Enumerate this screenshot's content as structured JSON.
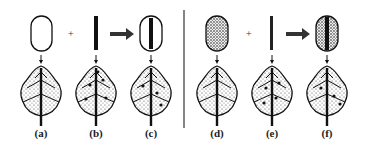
{
  "figure": {
    "operators": {
      "plus": "+",
      "arrow": "→"
    },
    "panels": [
      {
        "id": "a",
        "label": "(a)",
        "component": "empty-capsule",
        "x": 41
      },
      {
        "id": "b",
        "label": "(b)",
        "component": "solid-rod",
        "x": 96
      },
      {
        "id": "c",
        "label": "(c)",
        "component": "capsule-with-solid-rod",
        "x": 151
      },
      {
        "id": "d",
        "label": "(d)",
        "component": "speckled-capsule",
        "x": 217
      },
      {
        "id": "e",
        "label": "(e)",
        "component": "beaded-rod",
        "x": 272
      },
      {
        "id": "f",
        "label": "(f)",
        "component": "speckled-capsule-with-rod",
        "x": 327
      }
    ]
  }
}
